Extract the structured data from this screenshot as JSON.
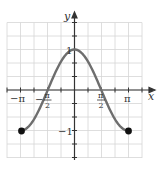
{
  "chart_data": {
    "type": "line",
    "title": "",
    "function": "y = cos(x)",
    "xlabel": "x",
    "ylabel": "y",
    "xlim": [
      -3.3,
      3.8
    ],
    "ylim": [
      -1.67,
      1.67
    ],
    "x_tick_labels": [
      "−π",
      "−π/2",
      "π/2",
      "π"
    ],
    "y_tick_labels": [
      "1",
      "−1"
    ],
    "grid": true,
    "series": [
      {
        "name": "cos(x)",
        "x": [
          -3.1416,
          -2.3562,
          -1.5708,
          -0.7854,
          0,
          0.7854,
          1.5708,
          2.3562,
          3.1416
        ],
        "values": [
          -1,
          -0.7071,
          0,
          0.7071,
          1,
          0.7071,
          0,
          -0.7071,
          -1
        ]
      }
    ],
    "endpoints": [
      {
        "x": -3.1416,
        "y": -1,
        "style": "closed"
      },
      {
        "x": 3.1416,
        "y": -1,
        "style": "closed"
      }
    ]
  },
  "labels": {
    "x_axis": "x",
    "y_axis": "y",
    "neg_pi": "−π",
    "pi": "π",
    "neg": "−",
    "pi_sym": "π",
    "two": "2",
    "one": "1",
    "neg_one": "−1"
  },
  "colors": {
    "curve": "#6e6e6e",
    "axis": "#333333",
    "grid": "#d8d8d8",
    "point": "#111111"
  }
}
